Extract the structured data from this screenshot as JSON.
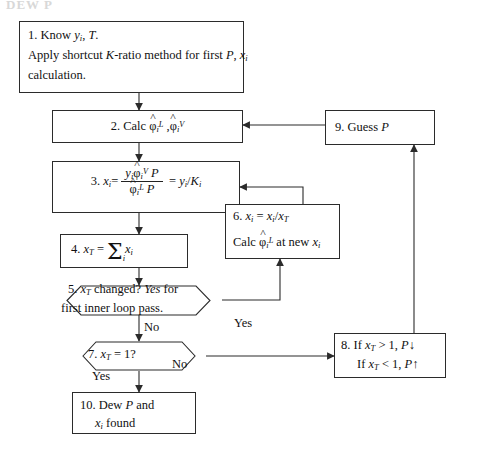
{
  "title": "DEW P",
  "diagram": {
    "type": "flowchart",
    "name": "Dew Point Pressure Iteration Flowchart",
    "nodes": [
      {
        "id": "n1",
        "shape": "rect",
        "data_name": "node-1-know-inputs",
        "lines": [
          "1. Know y_i, T.",
          "Apply shortcut K-ratio method for first P, x_i",
          "calculation."
        ]
      },
      {
        "id": "n2",
        "shape": "rect",
        "data_name": "node-2-calc-fugacity-coefficients",
        "lines": [
          "2. Calc φ̂_i^L , φ̂_i^V"
        ]
      },
      {
        "id": "n3",
        "shape": "rect",
        "data_name": "node-3-calc-liquid-composition",
        "lines": [
          "3. x_i = y_i φ̂_i^V P / φ̂_i^L P = y_i / K_i"
        ]
      },
      {
        "id": "n4",
        "shape": "rect",
        "data_name": "node-4-sum-x",
        "lines": [
          "4. x_T = Σ_i x_i"
        ]
      },
      {
        "id": "n5",
        "shape": "hexagon",
        "data_name": "node-5-decision-xt-changed",
        "lines": [
          "5. x_T changed? Yes for",
          "first inner loop pass."
        ]
      },
      {
        "id": "n6",
        "shape": "rect",
        "data_name": "node-6-normalize-and-recalc",
        "lines": [
          "6. x_i = x_i / x_T",
          "Calc φ̂_i^L at new x_i"
        ]
      },
      {
        "id": "n7",
        "shape": "hexagon",
        "data_name": "node-7-decision-xt-equals-one",
        "lines": [
          "7. x_T = 1?"
        ]
      },
      {
        "id": "n8",
        "shape": "rect",
        "data_name": "node-8-adjust-pressure",
        "lines": [
          "8. If x_T > 1, P ↓",
          "If x_T < 1, P ↑"
        ]
      },
      {
        "id": "n9",
        "shape": "rect",
        "data_name": "node-9-guess-p",
        "lines": [
          "9. Guess P"
        ]
      },
      {
        "id": "n10",
        "shape": "rect",
        "data_name": "node-10-result",
        "lines": [
          "10. Dew P and",
          "x_i found"
        ]
      }
    ],
    "edge_labels": {
      "n5_yes": "Yes",
      "n5_no": "No",
      "n7_yes": "Yes",
      "n7_no": "No"
    },
    "edges": [
      {
        "from": "n1",
        "to": "n2",
        "label": ""
      },
      {
        "from": "n2",
        "to": "n3",
        "label": ""
      },
      {
        "from": "n3",
        "to": "n4",
        "label": ""
      },
      {
        "from": "n4",
        "to": "n5",
        "label": ""
      },
      {
        "from": "n5",
        "to": "n6",
        "label": "Yes"
      },
      {
        "from": "n6",
        "to": "n3",
        "label": ""
      },
      {
        "from": "n5",
        "to": "n7",
        "label": "No"
      },
      {
        "from": "n7",
        "to": "n10",
        "label": "Yes"
      },
      {
        "from": "n7",
        "to": "n8",
        "label": "No"
      },
      {
        "from": "n8",
        "to": "n9",
        "label": ""
      },
      {
        "from": "n9",
        "to": "n2",
        "label": ""
      }
    ],
    "symbols": {
      "phi_hat_L": "φ̂_i^L",
      "phi_hat_V": "φ̂_i^V",
      "sigma": "Σ",
      "arrow_down": "↓",
      "arrow_up": "↑"
    }
  },
  "colors": {
    "stroke": "#2b2b2b",
    "text": "#111111",
    "background": "#ffffff",
    "title": "#d8d8d8"
  }
}
